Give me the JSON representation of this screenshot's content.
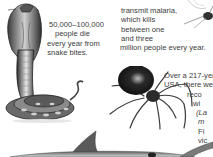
{
  "page": {
    "background": "#ffffff",
    "text_color": "#3c3c3c"
  },
  "snake_caption": {
    "lines": [
      "50,000–100,000",
      "people die",
      "every year from",
      "snake bites."
    ]
  },
  "malaria_caption": {
    "lines": [
      "transmit malaria,",
      "which kills",
      "between one",
      "and three",
      "million people every year."
    ]
  },
  "spider_caption": {
    "lines": [
      "Over a 217-yea",
      "USA, there we",
      "reco",
      "wi",
      "(La",
      "m",
      "Fi",
      "vic"
    ]
  },
  "illustrations": {
    "cobra": "cobra-illustration",
    "mosquito": "mosquito-illustration",
    "spider": "black-widow-spider-illustration",
    "shark": "shark-illustration"
  }
}
